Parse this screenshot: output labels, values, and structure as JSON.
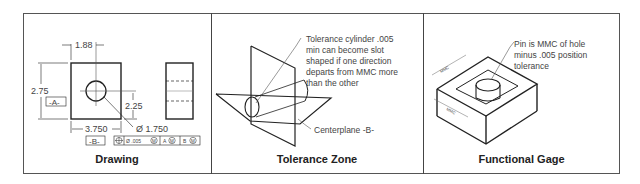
{
  "panels": [
    {
      "id": "drawing",
      "caption": "Drawing",
      "dimensions": {
        "hole_x": "1.88",
        "height": "2.75",
        "hole_y": "2.25",
        "width": "3.750",
        "hole_dia": "Ø 1.750"
      },
      "datums": {
        "a": "-A-",
        "b": "-B-"
      },
      "feature_control_frame": {
        "symbol": "⌖",
        "tolerance": "Ø .005",
        "modifier": "M",
        "datum1": "A",
        "datum1_mod": "M",
        "datum2": "B",
        "datum2_mod": "M"
      }
    },
    {
      "id": "tolerance-zone",
      "caption": "Tolerance Zone",
      "callout_lines": [
        "Tolerance cylinder .005",
        "min can become slot",
        "shaped if one direction",
        "departs from MMC more",
        "than the other"
      ],
      "centerplane_label": "Centerplane -B-"
    },
    {
      "id": "functional-gage",
      "caption": "Functional Gage",
      "callout_lines": [
        "Pin is MMC of hole",
        "minus .005 position",
        "tolerance"
      ],
      "dim_labels": {
        "top": "MMC",
        "top_sub": "A",
        "side": "MMC",
        "side_sub": "B"
      }
    }
  ]
}
